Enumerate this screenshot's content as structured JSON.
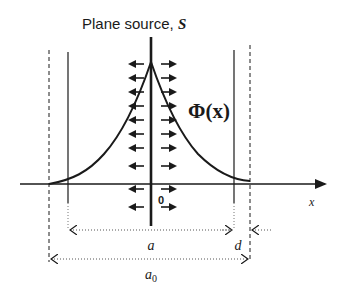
{
  "diagram": {
    "title_prefix": "Plane source, ",
    "title_symbol": "S",
    "flux_label": "Φ(x)",
    "origin_label": "0",
    "x_axis_label": "x",
    "dim_a_label": "a",
    "dim_d_label": "d",
    "dim_a0_label": "a",
    "dim_a0_subscript": "0",
    "colors": {
      "line": "#1a1a1a",
      "dotted": "#555555",
      "background": "#ffffff"
    }
  }
}
